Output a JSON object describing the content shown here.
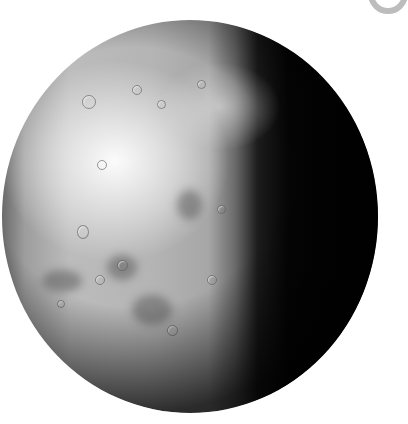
{
  "image": {
    "subject": "moon-like cratered sphere, lit from left",
    "colors": {
      "background": "#ffffff",
      "highlight": "#f5f5f5",
      "surface": "#a8a8a8",
      "terminator_dark": "#000000",
      "ring": "#bdbdbd"
    }
  }
}
